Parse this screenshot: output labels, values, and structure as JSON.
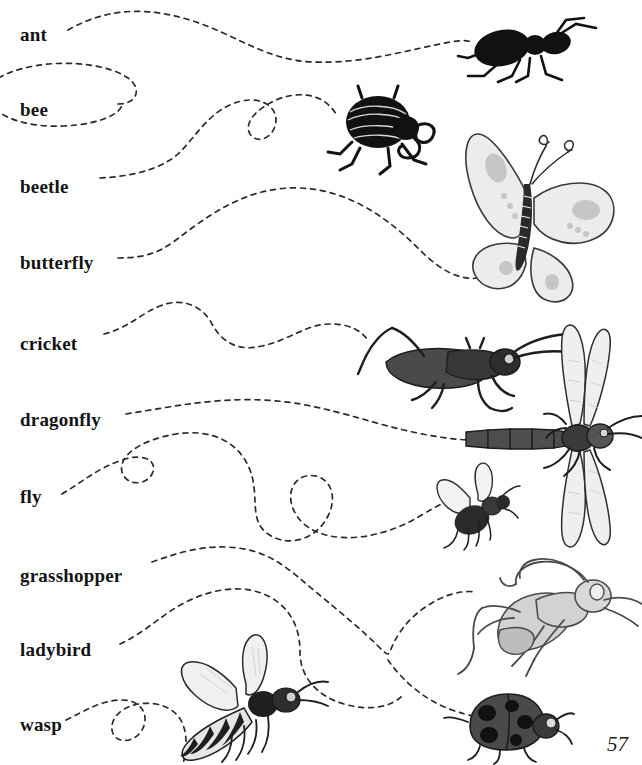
{
  "page": {
    "page_number": "57",
    "background_color": "#ffffff",
    "ink_color": "#2b2b2b",
    "width": 642,
    "height": 765
  },
  "labels": [
    {
      "text": "ant",
      "x": 20,
      "y": 25,
      "connects_to": "ant-illustration"
    },
    {
      "text": "bee",
      "x": 20,
      "y": 100,
      "connects_to": "bee-trail-offpage"
    },
    {
      "text": "beetle",
      "x": 20,
      "y": 177,
      "connects_to": "beetle-illustration"
    },
    {
      "text": "butterfly",
      "x": 20,
      "y": 253,
      "connects_to": "butterfly-illustration"
    },
    {
      "text": "cricket",
      "x": 20,
      "y": 334,
      "connects_to": "cricket-illustration"
    },
    {
      "text": "dragonfly",
      "x": 20,
      "y": 410,
      "connects_to": "dragonfly-illustration"
    },
    {
      "text": "fly",
      "x": 20,
      "y": 487,
      "connects_to": "fly-illustration"
    },
    {
      "text": "grasshopper",
      "x": 20,
      "y": 566,
      "connects_to": "grasshopper-illustration"
    },
    {
      "text": "ladybird",
      "x": 20,
      "y": 640,
      "connects_to": "ladybird-illustration"
    },
    {
      "text": "wasp",
      "x": 20,
      "y": 715,
      "connects_to": "wasp-illustration"
    }
  ],
  "illustrations": [
    {
      "name": "ant-illustration",
      "subject": "ant",
      "x": 463,
      "y": 22,
      "width": 122,
      "height": 70,
      "shading": "solid black silhouette"
    },
    {
      "name": "beetle-illustration",
      "subject": "beetle",
      "x": 325,
      "y": 88,
      "width": 125,
      "height": 82,
      "shading": "solid black, ribbed elytra, curled antennae"
    },
    {
      "name": "butterfly-illustration",
      "subject": "butterfly",
      "x": 447,
      "y": 125,
      "width": 188,
      "height": 150,
      "shading": "pale grey wings, dark striped body"
    },
    {
      "name": "cricket-illustration",
      "subject": "cricket",
      "x": 360,
      "y": 328,
      "width": 172,
      "height": 82,
      "shading": "dark grey body, long legs"
    },
    {
      "name": "dragonfly-illustration",
      "subject": "dragonfly",
      "x": 462,
      "y": 330,
      "width": 180,
      "height": 222,
      "shading": "pale translucent wings, segmented abdomen"
    },
    {
      "name": "fly-illustration",
      "subject": "fly",
      "x": 437,
      "y": 478,
      "width": 80,
      "height": 62,
      "shading": "dark body, pale wings"
    },
    {
      "name": "grasshopper-illustration",
      "subject": "grasshopper",
      "x": 455,
      "y": 558,
      "width": 187,
      "height": 115,
      "shading": "mid-grey line art, long hind legs"
    },
    {
      "name": "ladybird-illustration",
      "subject": "ladybird",
      "x": 462,
      "y": 690,
      "width": 112,
      "height": 70,
      "shading": "dark grey dome with black spots"
    },
    {
      "name": "wasp-illustration",
      "subject": "wasp",
      "x": 148,
      "y": 622,
      "width": 158,
      "height": 135,
      "shading": "striped abdomen, pale wings"
    }
  ],
  "connector_lines": {
    "style": "hand-drawn dashed curve",
    "dash_pattern": "5 5",
    "stroke_width": 1.7,
    "count": 10
  }
}
